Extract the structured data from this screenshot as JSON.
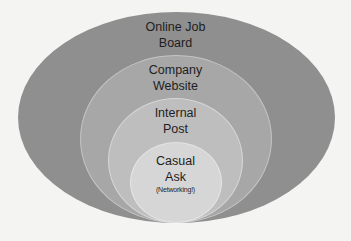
{
  "diagram": {
    "type": "nested-ellipses",
    "title": "",
    "layers": [
      {
        "id": "outer",
        "label_line1": "Online Job",
        "label_line2": "Board",
        "color": "#8f8f8f"
      },
      {
        "id": "second",
        "label_line1": "Company",
        "label_line2": "Website",
        "color": "#a7a7a7"
      },
      {
        "id": "third",
        "label_line1": "Internal",
        "label_line2": "Post",
        "color": "#bebebe"
      },
      {
        "id": "inner",
        "label_line1": "Casual",
        "label_line2": "Ask",
        "sublabel": "(Networking!)",
        "color": "#d6d6d6"
      }
    ]
  }
}
